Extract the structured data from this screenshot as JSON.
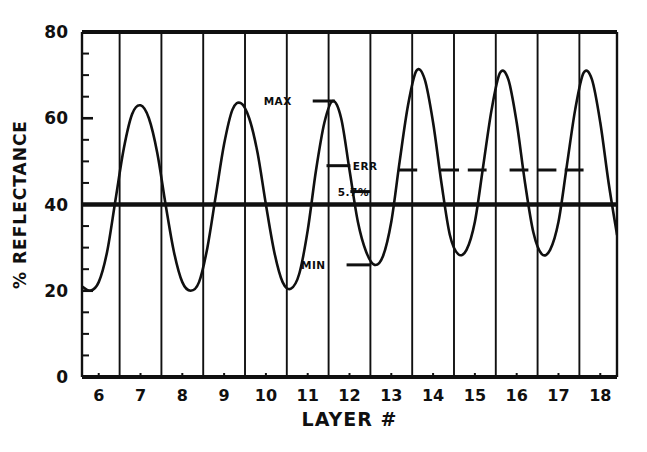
{
  "chart_data": {
    "type": "line",
    "title": "",
    "subtitle": "",
    "xlabel": "LAYER #",
    "ylabel": "% REFLECTANCE",
    "xlim": [
      5.6,
      18.4
    ],
    "ylim": [
      0,
      80
    ],
    "grid": "vertical gridlines at half-integer layer boundaries",
    "legend": "none",
    "x_tick_labels": [
      "6",
      "7",
      "8",
      "9",
      "10",
      "11",
      "12",
      "13",
      "14",
      "15",
      "16",
      "17",
      "18"
    ],
    "x_tick_values": [
      6,
      7,
      8,
      9,
      10,
      11,
      12,
      13,
      14,
      15,
      16,
      17,
      18
    ],
    "y_tick_labels": [
      "0",
      "20",
      "40",
      "60",
      "80"
    ],
    "y_tick_values": [
      0,
      20,
      40,
      60,
      80
    ],
    "y_minor_tick_step": 5,
    "gridline_x_values": [
      6.5,
      7.5,
      8.5,
      9.5,
      10.5,
      11.5,
      12.5,
      13.5,
      14.5,
      15.5,
      16.5,
      17.5
    ],
    "series": [
      {
        "name": "reflectance",
        "x": [
          5.6,
          5.8,
          6.0,
          6.2,
          6.4,
          6.6,
          6.8,
          7.0,
          7.2,
          7.4,
          7.6,
          7.8,
          8.0,
          8.2,
          8.4,
          8.6,
          8.8,
          9.0,
          9.2,
          9.4,
          9.6,
          9.8,
          10.0,
          10.2,
          10.4,
          10.6,
          10.8,
          11.0,
          11.2,
          11.4,
          11.6,
          11.8,
          12.0,
          12.2,
          12.4,
          12.6,
          12.8,
          13.0,
          13.2,
          13.4,
          13.6,
          13.8,
          14.0,
          14.2,
          14.4,
          14.6,
          14.8,
          15.0,
          15.2,
          15.4,
          15.6,
          15.8,
          16.0,
          16.2,
          16.4,
          16.6,
          16.8,
          17.0,
          17.2,
          17.4,
          17.6,
          17.8,
          18.0,
          18.2,
          18.4
        ],
        "y": [
          21.0,
          20.0,
          22.0,
          29.0,
          41.0,
          53.0,
          61.0,
          63.0,
          60.0,
          52.0,
          40.0,
          29.0,
          22.0,
          20.0,
          22.0,
          30.0,
          42.0,
          54.0,
          62.0,
          63.5,
          60.0,
          52.0,
          40.0,
          29.0,
          22.0,
          20.5,
          24.0,
          34.0,
          48.0,
          59.0,
          64.0,
          60.0,
          48.0,
          36.0,
          29.0,
          26.0,
          28.0,
          36.0,
          50.0,
          63.0,
          71.0,
          69.0,
          59.0,
          45.0,
          33.0,
          28.5,
          29.5,
          36.0,
          49.0,
          62.0,
          70.5,
          69.0,
          59.0,
          45.0,
          33.5,
          28.5,
          29.5,
          36.0,
          49.0,
          62.0,
          70.5,
          69.0,
          59.0,
          45.0,
          33.0
        ]
      }
    ],
    "reference_line": {
      "label": "",
      "y_value": 40,
      "style": "thick solid horizontal line spanning full plot width"
    },
    "annotations": [
      {
        "id": "max",
        "label": "MAX",
        "y_value": 64.0,
        "x_from": 11.12,
        "x_to": 11.65,
        "label_x": 10.62,
        "description": "horizontal tick at curve maximum with MAX text to the left"
      },
      {
        "id": "err",
        "label": "ERR",
        "y_value": 49.0,
        "x_from": 11.45,
        "x_to": 12.02,
        "label_x": 12.08,
        "description": "horizontal tick marking error band upper bound with ERR text to the right"
      },
      {
        "id": "percent",
        "label": "5.7%",
        "y_value": 43.0,
        "x_from": 12.02,
        "x_to": 12.5,
        "label_x": 11.72,
        "description": "percentage error value with horizontal tick to the right"
      },
      {
        "id": "min",
        "label": "MIN",
        "y_value": 26.0,
        "x_from": 11.93,
        "x_to": 12.52,
        "label_x": 11.43,
        "description": "horizontal tick at curve minimum with MIN text to the left"
      }
    ],
    "dash_marks": {
      "y_value": 48.0,
      "description": "short horizontal dashes crossing the curve on the right half of the plot",
      "x_spans": [
        [
          13.18,
          13.62
        ],
        [
          14.18,
          14.62
        ],
        [
          14.83,
          15.28
        ],
        [
          15.83,
          16.28
        ],
        [
          16.5,
          16.95
        ],
        [
          17.15,
          17.6
        ]
      ]
    }
  },
  "figure": {
    "background_color": "#ffffff",
    "ink_color": "#101010",
    "curve_color": "#101010"
  }
}
